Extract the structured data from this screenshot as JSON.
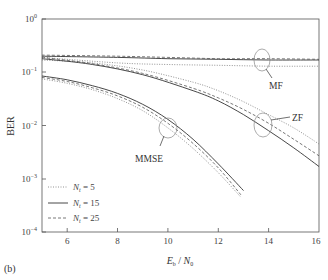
{
  "panel_label": "(b)",
  "chart_data": {
    "type": "line",
    "title": "",
    "xlabel": "E_b / N_0",
    "ylabel": "BER",
    "xlim": [
      5,
      16
    ],
    "ylim": [
      0.0001,
      1
    ],
    "yscale": "log",
    "x_ticks": [
      6,
      8,
      10,
      12,
      14,
      16
    ],
    "y_ticks": [
      "10^0",
      "10^-1",
      "10^-2",
      "10^-3",
      "10^-4"
    ],
    "grid": false,
    "legend_position": "lower left",
    "legend": [
      {
        "label": "N_t = 5",
        "style": "dotted"
      },
      {
        "label": "N_t = 15",
        "style": "solid"
      },
      {
        "label": "N_t = 25",
        "style": "dashed"
      }
    ],
    "annotations": [
      "MF",
      "ZF",
      "MMSE"
    ],
    "series": [
      {
        "name": "MF, N_t = 5",
        "style": "dotted",
        "x": [
          5,
          8,
          10,
          12,
          14,
          16
        ],
        "y": [
          0.19,
          0.15,
          0.14,
          0.135,
          0.13,
          0.13
        ]
      },
      {
        "name": "MF, N_t = 15",
        "style": "solid",
        "x": [
          5,
          8,
          10,
          12,
          14,
          16
        ],
        "y": [
          0.2,
          0.19,
          0.18,
          0.175,
          0.17,
          0.17
        ]
      },
      {
        "name": "MF, N_t = 25",
        "style": "dashed",
        "x": [
          5,
          8,
          10,
          12,
          14,
          16
        ],
        "y": [
          0.21,
          0.2,
          0.19,
          0.18,
          0.18,
          0.175
        ]
      },
      {
        "name": "ZF, N_t = 5",
        "style": "dotted",
        "x": [
          5,
          7,
          9,
          11,
          12,
          13,
          14,
          15,
          16
        ],
        "y": [
          0.17,
          0.15,
          0.11,
          0.065,
          0.045,
          0.028,
          0.016,
          0.009,
          0.0045
        ]
      },
      {
        "name": "ZF, N_t = 15",
        "style": "solid",
        "x": [
          5,
          7,
          9,
          11,
          12,
          13,
          14,
          15,
          16
        ],
        "y": [
          0.18,
          0.14,
          0.09,
          0.045,
          0.029,
          0.016,
          0.008,
          0.0038,
          0.0017
        ]
      },
      {
        "name": "ZF, N_t = 25",
        "style": "dashed",
        "x": [
          5,
          7,
          9,
          11,
          12,
          13,
          14,
          15,
          16
        ],
        "y": [
          0.19,
          0.145,
          0.095,
          0.05,
          0.033,
          0.02,
          0.011,
          0.0055,
          0.0027
        ]
      },
      {
        "name": "MMSE, N_t = 5",
        "style": "dotted",
        "x": [
          5,
          6,
          7,
          8,
          9,
          10,
          11,
          12,
          12.9
        ],
        "y": [
          0.075,
          0.062,
          0.047,
          0.032,
          0.019,
          0.009,
          0.0037,
          0.0013,
          0.00045
        ]
      },
      {
        "name": "MMSE, N_t = 15",
        "style": "solid",
        "x": [
          5,
          6,
          7,
          8,
          9,
          10,
          11,
          12,
          13
        ],
        "y": [
          0.085,
          0.072,
          0.056,
          0.04,
          0.025,
          0.013,
          0.0055,
          0.0019,
          0.0006
        ]
      },
      {
        "name": "MMSE, N_t = 25",
        "style": "dashed",
        "x": [
          5,
          6,
          7,
          8,
          9,
          10,
          11,
          12,
          12.9
        ],
        "y": [
          0.08,
          0.067,
          0.051,
          0.036,
          0.022,
          0.011,
          0.0046,
          0.0016,
          0.0005
        ]
      }
    ]
  }
}
